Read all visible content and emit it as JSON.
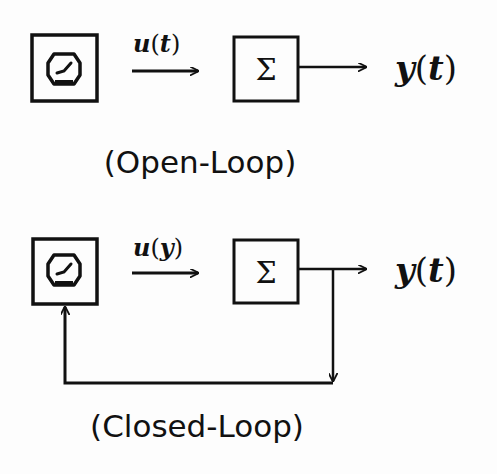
{
  "diagrams": [
    {
      "id": "open-loop",
      "caption": "(Open-Loop)",
      "controller_icon": "clock-icon",
      "input_signal": {
        "var": "u",
        "arg": "t"
      },
      "summation_symbol": "Σ",
      "output_signal": {
        "var": "y",
        "arg": "t"
      },
      "feedback": false
    },
    {
      "id": "closed-loop",
      "caption": "(Closed-Loop)",
      "controller_icon": "clock-icon",
      "input_signal": {
        "var": "u",
        "arg": "y"
      },
      "summation_symbol": "Σ",
      "output_signal": {
        "var": "y",
        "arg": "t"
      },
      "feedback": true
    }
  ],
  "colors": {
    "stroke": "#111111",
    "background": "#fdfdfd"
  }
}
